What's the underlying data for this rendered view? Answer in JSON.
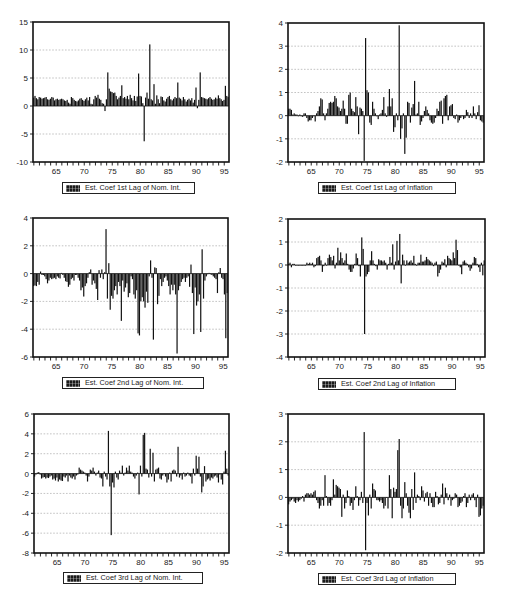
{
  "colors": {
    "bar": "#111111",
    "grid": "#9a9a9a",
    "frame": "#111111",
    "background": "#ffffff"
  },
  "chart_data": [
    {
      "type": "bar",
      "title": "",
      "legend": "Est. Coef 1st Lag of Nom. Int.",
      "legend_position": "bottom",
      "xlabel": "",
      "ylabel": "",
      "x_start": "1961Q1",
      "x_end": "1995Q4",
      "frequency": "quarterly",
      "xlim": [
        60.85,
        95.85
      ],
      "xticks": [
        65,
        70,
        75,
        80,
        85,
        90,
        95
      ],
      "xticklabels": [
        "65",
        "70",
        "75",
        "80",
        "85",
        "90",
        "95"
      ],
      "ylim": [
        -10,
        15
      ],
      "yticks": [
        -10,
        -5,
        0,
        5,
        10,
        15
      ],
      "grid": true,
      "values": [
        1.5,
        1.8,
        1.4,
        1.2,
        1.6,
        1.5,
        1.3,
        1.4,
        1.5,
        1.6,
        1.2,
        1.1,
        1.3,
        1.6,
        1.5,
        1.0,
        1.2,
        1.3,
        1.1,
        1.2,
        1.3,
        1.2,
        1.0,
        0.9,
        1.1,
        0.6,
        0.4,
        1.6,
        1.4,
        1.1,
        0.9,
        0.8,
        1.0,
        1.3,
        1.4,
        1.1,
        0.9,
        1.2,
        1.5,
        1.0,
        1.6,
        0.4,
        0.3,
        1.2,
        1.8,
        1.5,
        2.0,
        1.3,
        1.1,
        0.5,
        0.4,
        -0.9,
        1.2,
        6.0,
        3.1,
        2.6,
        2.5,
        2.3,
        2.4,
        1.8,
        1.2,
        1.5,
        1.8,
        3.7,
        1.4,
        1.6,
        1.3,
        1.8,
        1.2,
        2.0,
        1.4,
        1.0,
        1.8,
        0.9,
        1.7,
        5.8,
        1.8,
        1.7,
        0.5,
        -6.3,
        1.5,
        2.4,
        1.3,
        11.0,
        1.2,
        1.0,
        3.9,
        0.4,
        1.9,
        1.2,
        0.5,
        1.7,
        1.6,
        1.0,
        0.8,
        1.3,
        1.6,
        1.8,
        1.2,
        1.0,
        1.3,
        1.6,
        1.4,
        4.2,
        1.5,
        1.3,
        1.0,
        1.6,
        1.2,
        0.8,
        1.1,
        1.3,
        1.0,
        1.4,
        0.6,
        1.1,
        3.3,
        -0.4,
        1.1,
        6.0,
        1.6,
        1.5,
        1.4,
        1.3,
        1.2,
        1.4,
        1.6,
        1.3,
        1.1,
        1.2,
        1.5,
        1.3,
        1.9,
        1.4,
        1.2,
        0.9,
        1.1,
        3.6,
        1.8,
        1.6
      ]
    },
    {
      "type": "bar",
      "title": "",
      "legend": "Est. Coef 1st Lag of Inflation",
      "legend_position": "bottom",
      "xlabel": "",
      "ylabel": "",
      "x_start": "1961Q1",
      "x_end": "1995Q4",
      "frequency": "quarterly",
      "xlim": [
        60.85,
        95.85
      ],
      "xticks": [
        65,
        70,
        75,
        80,
        85,
        90,
        95
      ],
      "xticklabels": [
        "65",
        "70",
        "75",
        "80",
        "85",
        "90",
        "95"
      ],
      "ylim": [
        -2,
        4
      ],
      "yticks": [
        -2,
        -1,
        0,
        1,
        2,
        3,
        4
      ],
      "grid": true,
      "values": [
        0.3,
        0.3,
        0.25,
        0.05,
        0.1,
        0.05,
        0.05,
        0.0,
        0.05,
        0.0,
        -0.05,
        0.1,
        0.1,
        -0.1,
        -0.25,
        -0.2,
        -0.2,
        -0.1,
        0.0,
        -0.25,
        0.1,
        0.2,
        0.4,
        0.75,
        0.7,
        0.1,
        -0.2,
        0.1,
        0.3,
        0.55,
        0.6,
        0.55,
        0.6,
        0.85,
        0.75,
        0.4,
        0.35,
        0.2,
        0.3,
        0.65,
        0.3,
        -0.35,
        -0.35,
        0.9,
        1.0,
        0.3,
        0.2,
        0.15,
        0.8,
        0.4,
        -0.8,
        0.35,
        0.3,
        0.2,
        -1.95,
        3.35,
        1.1,
        1.0,
        -0.3,
        -0.4,
        0.6,
        0.3,
        0.1,
        0.0,
        -0.15,
        0.05,
        0.1,
        0.25,
        0.8,
        0.1,
        -0.05,
        0.4,
        1.15,
        0.4,
        0.75,
        -0.7,
        -0.5,
        0.1,
        -0.2,
        3.9,
        -1.0,
        -0.55,
        0.1,
        -1.65,
        -0.95,
        0.6,
        0.55,
        -0.3,
        0.35,
        0.5,
        1.5,
        0.05,
        0.1,
        0.6,
        -0.4,
        -0.25,
        -0.1,
        0.2,
        0.4,
        0.25,
        0.1,
        -0.2,
        -0.3,
        -0.35,
        -0.3,
        -0.1,
        0.3,
        0.2,
        0.6,
        0.65,
        -0.35,
        0.75,
        0.85,
        0.9,
        -0.2,
        0.4,
        0.45,
        0.5,
        -0.1,
        -0.15,
        0.05,
        -0.3,
        -0.2,
        -0.1,
        0.0,
        -0.15,
        -0.1,
        0.25,
        0.15,
        -0.1,
        0.1,
        -0.1,
        0.4,
        0.1,
        -0.15,
        0.15,
        0.45,
        -0.2,
        -0.25,
        -0.3
      ]
    },
    {
      "type": "bar",
      "title": "",
      "legend": "Est. Coef 2nd Lag of Nom. Int.",
      "legend_position": "bottom",
      "xlabel": "",
      "ylabel": "",
      "x_start": "1961Q1",
      "x_end": "1995Q4",
      "frequency": "quarterly",
      "xlim": [
        60.85,
        95.85
      ],
      "xticks": [
        65,
        70,
        75,
        80,
        85,
        90,
        95
      ],
      "xticklabels": [
        "65",
        "70",
        "75",
        "80",
        "85",
        "90",
        "95"
      ],
      "ylim": [
        -6,
        4
      ],
      "yticks": [
        -6,
        -4,
        -2,
        0,
        2,
        4
      ],
      "grid": true,
      "values": [
        -0.9,
        -0.85,
        -0.9,
        -0.6,
        -0.8,
        0.15,
        -0.1,
        -0.1,
        -0.2,
        -0.4,
        -0.7,
        -0.5,
        -0.3,
        -0.4,
        -0.35,
        -0.3,
        -0.4,
        -0.2,
        -0.3,
        -0.35,
        0.05,
        -0.1,
        -0.3,
        -0.55,
        -0.6,
        -0.95,
        -0.8,
        -0.4,
        -0.3,
        -0.5,
        -0.1,
        -0.1,
        -0.3,
        -0.5,
        -1.2,
        -1.0,
        -1.65,
        -0.9,
        -0.7,
        -0.3,
        0.1,
        0.3,
        -0.8,
        -0.5,
        -0.7,
        -1.1,
        -1.9,
        0.25,
        -0.3,
        0.3,
        -0.4,
        0.1,
        3.2,
        -1.8,
        0.75,
        -2.6,
        -1.6,
        -1.8,
        -1.2,
        -0.9,
        -1.5,
        -0.6,
        -0.9,
        -3.4,
        -0.5,
        -1.3,
        -1.0,
        -0.7,
        -1.7,
        -1.4,
        -0.2,
        -0.4,
        -1.5,
        -1.8,
        -1.2,
        -4.3,
        -4.45,
        -2.0,
        -1.7,
        -2.0,
        -2.45,
        -1.3,
        -2.1,
        -0.2,
        0.95,
        -0.3,
        -4.75,
        0.45,
        0.4,
        -2.2,
        -1.6,
        -0.4,
        -0.9,
        -0.6,
        -0.3,
        -0.2,
        -0.5,
        -0.9,
        -1.5,
        -0.8,
        -1.2,
        -0.8,
        -1.5,
        -5.75,
        -1.2,
        -0.9,
        -0.6,
        -0.4,
        -0.3,
        -0.6,
        -0.3,
        -0.2,
        -0.95,
        0.65,
        -1.4,
        -4.35,
        -1.0,
        -2.3,
        -2.0,
        -1.5,
        -4.2,
        1.75,
        -1.8,
        -0.5,
        -0.2,
        -0.05,
        0.05,
        -0.05,
        -0.1,
        -0.2,
        -0.3,
        -0.4,
        -1.4,
        0.1,
        0.4,
        -0.3,
        -0.4,
        -1.5,
        -4.65,
        -1.4
      ]
    },
    {
      "type": "bar",
      "title": "",
      "legend": "Est. Coef 2nd Lag of Inflation",
      "legend_position": "bottom",
      "xlabel": "",
      "ylabel": "",
      "x_start": "1961Q1",
      "x_end": "1995Q4",
      "frequency": "quarterly",
      "xlim": [
        60.85,
        95.85
      ],
      "xticks": [
        65,
        70,
        75,
        80,
        85,
        90,
        95
      ],
      "xticklabels": [
        "65",
        "70",
        "75",
        "80",
        "85",
        "90",
        "95"
      ],
      "ylim": [
        -4,
        2
      ],
      "yticks": [
        -4,
        -3,
        -2,
        -1,
        0,
        1,
        2
      ],
      "grid": true,
      "values": [
        0.05,
        0.1,
        -0.1,
        0.05,
        0.05,
        0.0,
        0.0,
        0.0,
        0.0,
        0.0,
        0.0,
        0.0,
        0.0,
        0.1,
        0.05,
        0.1,
        0.05,
        0.1,
        -0.1,
        -0.05,
        0.3,
        0.35,
        0.4,
        0.2,
        -0.3,
        -0.05,
        0.1,
        0.0,
        0.3,
        0.45,
        0.35,
        0.2,
        0.4,
        -0.15,
        0.1,
        0.75,
        0.2,
        0.55,
        0.3,
        0.1,
        0.2,
        0.5,
        0.05,
        -0.2,
        -0.3,
        -0.3,
        -0.15,
        0.05,
        0.5,
        0.3,
        -0.05,
        -0.5,
        1.2,
        0.7,
        -3.0,
        -0.5,
        -0.4,
        -0.3,
        0.2,
        0.6,
        0.2,
        0.05,
        -0.05,
        -0.2,
        0.25,
        0.2,
        0.2,
        0.15,
        0.2,
        0.1,
        -0.2,
        0.05,
        0.35,
        0.1,
        0.9,
        -0.2,
        0.15,
        1.05,
        0.2,
        1.35,
        -0.8,
        0.45,
        0.2,
        0.0,
        0.2,
        0.1,
        0.15,
        0.2,
        0.1,
        0.4,
        0.05,
        0.0,
        0.1,
        0.1,
        0.45,
        0.15,
        0.15,
        0.2,
        0.35,
        0.25,
        0.2,
        0.15,
        0.1,
        -0.05,
        0.1,
        0.15,
        -0.5,
        -0.35,
        -0.2,
        0.15,
        0.1,
        0.25,
        -0.1,
        0.4,
        0.3,
        0.25,
        0.2,
        0.55,
        0.3,
        1.1,
        0.65,
        0.0,
        -0.1,
        -0.4,
        0.15,
        0.2,
        0.1,
        0.05,
        -0.1,
        -0.25,
        -0.15,
        0.1,
        0.35,
        0.3,
        0.05,
        -0.1,
        -0.3,
        0.1,
        -0.45,
        0.2
      ]
    },
    {
      "type": "bar",
      "title": "",
      "legend": "Est. Coef 3rd Lag of Nom. Int.",
      "legend_position": "bottom",
      "xlabel": "",
      "ylabel": "",
      "x_start": "1961Q1",
      "x_end": "1995Q4",
      "frequency": "quarterly",
      "xlim": [
        60.85,
        95.85
      ],
      "xticks": [
        65,
        70,
        75,
        80,
        85,
        90,
        95
      ],
      "xticklabels": [
        "65",
        "70",
        "75",
        "80",
        "85",
        "90",
        "95"
      ],
      "ylim": [
        -8,
        6
      ],
      "yticks": [
        -8,
        -6,
        -4,
        -2,
        0,
        2,
        4,
        6
      ],
      "grid": true,
      "values": [
        -0.3,
        -0.1,
        0.1,
        0.15,
        -0.1,
        -0.5,
        -0.4,
        -0.35,
        -0.5,
        -0.4,
        -0.45,
        -0.3,
        -0.2,
        -0.6,
        -0.5,
        -0.7,
        -0.4,
        -0.8,
        -0.6,
        -0.7,
        -0.75,
        -0.3,
        -0.4,
        -0.2,
        -0.8,
        -0.2,
        -0.4,
        -0.5,
        -0.3,
        -0.6,
        -0.2,
        -0.1,
        0.6,
        0.4,
        0.3,
        0.2,
        0.1,
        -0.2,
        -0.8,
        -0.3,
        0.4,
        0.3,
        0.6,
        0.2,
        -0.2,
        0.1,
        0.3,
        -0.4,
        -0.5,
        -1.3,
        0.2,
        -0.3,
        -0.6,
        4.3,
        -1.3,
        -6.2,
        -0.9,
        -1.4,
        0.2,
        -0.4,
        -0.6,
        0.3,
        0.1,
        0.8,
        -0.2,
        0.1,
        0.6,
        0.3,
        0.8,
        0.2,
        0.1,
        -0.3,
        -0.5,
        -0.2,
        0.1,
        -2.1,
        0.8,
        -0.3,
        3.9,
        4.1,
        0.5,
        0.4,
        -0.4,
        2.5,
        -0.3,
        2.1,
        -0.8,
        0.4,
        0.5,
        0.6,
        -0.5,
        -0.6,
        -0.2,
        0.0,
        -0.3,
        -0.9,
        -0.6,
        0.1,
        -0.8,
        0.3,
        0.4,
        0.3,
        -0.3,
        2.7,
        -0.4,
        -0.2,
        -0.6,
        0.1,
        -0.3,
        -0.2,
        0.1,
        -0.2,
        -0.3,
        -1.0,
        0.5,
        -0.2,
        1.8,
        0.5,
        1.7,
        -0.3,
        -1.9,
        -1.3,
        0.75,
        -0.8,
        -0.6,
        -0.5,
        -0.7,
        -0.4,
        -0.5,
        -0.3,
        -0.2,
        -0.4,
        -0.9,
        -0.1,
        -0.6,
        -1.1,
        0.2,
        2.3,
        0.5,
        -0.2
      ]
    },
    {
      "type": "bar",
      "title": "",
      "legend": "Est. Coef 3rd Lag of Inflation",
      "legend_position": "bottom",
      "xlabel": "",
      "ylabel": "",
      "x_start": "1961Q1",
      "x_end": "1995Q4",
      "frequency": "quarterly",
      "xlim": [
        60.85,
        95.85
      ],
      "xticks": [
        65,
        70,
        75,
        80,
        85,
        90,
        95
      ],
      "xticklabels": [
        "65",
        "70",
        "75",
        "80",
        "85",
        "90",
        "95"
      ],
      "ylim": [
        -2,
        3
      ],
      "yticks": [
        -2,
        -1,
        0,
        1,
        2,
        3
      ],
      "grid": true,
      "values": [
        -0.25,
        -0.15,
        -0.1,
        -0.05,
        -0.15,
        -0.2,
        -0.1,
        -0.15,
        -0.1,
        -0.05,
        0.05,
        -0.15,
        0.1,
        0.15,
        0.15,
        0.1,
        0.15,
        0.1,
        0.2,
        0.25,
        -0.1,
        -0.2,
        -0.4,
        -0.3,
        -0.1,
        -0.3,
        0.8,
        0.05,
        -0.3,
        -0.2,
        -0.3,
        -0.1,
        0.65,
        0.1,
        0.45,
        0.4,
        0.35,
        0.3,
        -0.7,
        0.1,
        -0.4,
        -0.2,
        0.25,
        0.05,
        -0.3,
        -0.2,
        -0.45,
        -0.1,
        0.4,
        0.05,
        -0.3,
        -0.1,
        0.2,
        -0.2,
        2.35,
        -1.9,
        -0.2,
        -0.65,
        0.1,
        -0.4,
        0.5,
        0.3,
        0.25,
        -0.1,
        -0.1,
        -0.15,
        -0.1,
        -0.2,
        -0.4,
        -0.3,
        0.0,
        -0.4,
        0.8,
        0.3,
        -0.75,
        0.35,
        0.2,
        0.3,
        1.7,
        2.1,
        -0.3,
        -0.75,
        -0.4,
        0.55,
        0.15,
        -0.3,
        -0.55,
        -0.75,
        0.3,
        -0.45,
        0.9,
        -0.2,
        0.1,
        0.05,
        -0.1,
        0.4,
        0.25,
        -0.15,
        0.15,
        0.2,
        -0.3,
        0.15,
        -0.2,
        -0.35,
        -0.35,
        0.2,
        0.05,
        -0.25,
        -0.2,
        0.1,
        0.5,
        -0.25,
        0.35,
        0.15,
        -0.1,
        0.1,
        -0.3,
        -0.1,
        -0.05,
        0.15,
        0.1,
        -0.35,
        -0.3,
        -0.2,
        -0.15,
        0.05,
        0.15,
        -0.35,
        -0.2,
        0.1,
        -0.1,
        0.1,
        0.15,
        -0.1,
        -0.35,
        0.1,
        -0.7,
        -0.65,
        -0.4,
        -0.3
      ]
    }
  ]
}
